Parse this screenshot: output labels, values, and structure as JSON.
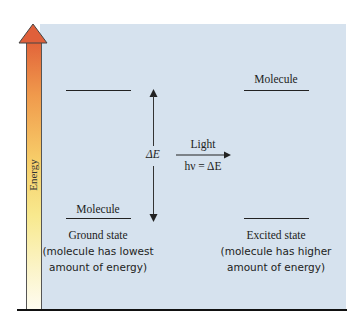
{
  "axis": {
    "label": "Energy",
    "gradient_colors": [
      "#e2643a",
      "#f09a4c",
      "#f8e98e",
      "#fefcf0"
    ]
  },
  "panel": {
    "background": "#d6e2ee"
  },
  "ground_state": {
    "molecule_label": "Molecule",
    "title": "Ground state",
    "description_line1": "(molecule has lowest",
    "description_line2": "amount of energy)"
  },
  "excited_state": {
    "molecule_label": "Molecule",
    "title": "Excited state",
    "description_line1": "(molecule has higher",
    "description_line2": "amount of energy)"
  },
  "energy_gap": {
    "label": "ΔE"
  },
  "transition": {
    "label_top": "Light",
    "label_bottom": "hν = ΔE"
  }
}
